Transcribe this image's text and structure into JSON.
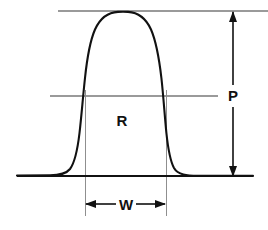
{
  "figure": {
    "background_color": "#ffffff",
    "curve_color": "#111111",
    "baseline_color": "#111111",
    "reference_line_color": "#9a9a9a",
    "dimension_line_color": "#111111",
    "label_color": "#111111"
  },
  "labels": {
    "response_region": "R",
    "peak_height": "P",
    "peak_width": "W"
  },
  "chart_data": {
    "type": "line",
    "xlabel": "",
    "ylabel": "",
    "grid": false,
    "legend": false,
    "xlim": [
      17,
      253
    ],
    "ylim": [
      176,
      11
    ],
    "annotations": [
      {
        "name": "peak-height",
        "label": "P",
        "kind": "vertical-double-arrow",
        "x": 233,
        "y_from": 176,
        "y_to": 12,
        "label_x": 233,
        "label_y": 96
      },
      {
        "name": "peak-width-half-height",
        "label": "W",
        "kind": "horizontal-double-arrow",
        "y": 204,
        "x_from": 85,
        "x_to": 166,
        "label_x": 126,
        "label_y": 204
      },
      {
        "name": "region",
        "label": "R",
        "kind": "area-label",
        "label_x": 122,
        "label_y": 120
      }
    ],
    "reference_lines": [
      {
        "name": "peak-apex-line",
        "orientation": "horizontal",
        "y": 11,
        "x_from": 58,
        "x_to": 268
      },
      {
        "name": "half-height-line",
        "orientation": "horizontal",
        "y": 96,
        "x_from": 50,
        "x_to": 218
      },
      {
        "name": "left-width-drop-line",
        "orientation": "vertical",
        "x": 85,
        "y_from": 96,
        "y_to": 216
      },
      {
        "name": "right-width-drop-line",
        "orientation": "vertical",
        "x": 166,
        "y_from": 96,
        "y_to": 216
      }
    ],
    "baseline": {
      "name": "baseline",
      "y": 176,
      "x_from": 17,
      "x_to": 253
    },
    "curve": {
      "name": "peak-curve",
      "apex_x": 125,
      "apex_y": 12,
      "half_height_y": 96,
      "half_height_left_x": 85,
      "half_height_right_x": 166,
      "path": "M 17 175.6 L 50 175.4 C 60 175.2 66 174.0 70 169.0 C 74.5 163.0 77.5 150.0 79.5 133.0 C 81.5 116.0 83.0 96.0 85.0 78.0 C 87.0 59.0 90.0 41.0 95.0 29.5 C 100.5 17.5 109.0 12.3 118.0 11.9 C 121.5 11.7 124.5 11.7 128.0 11.9 C 137.0 12.4 145.5 17.5 151.0 29.5 C 156.0 41.0 159.2 59.0 161.4 78.0 C 163.4 96.0 164.7 116.0 166.4 133.0 C 168.1 149.0 170.5 161.5 174.0 168.0 C 178.0 175.0 187.0 175.6 198.0 175.8 L 253 175.9"
    }
  }
}
